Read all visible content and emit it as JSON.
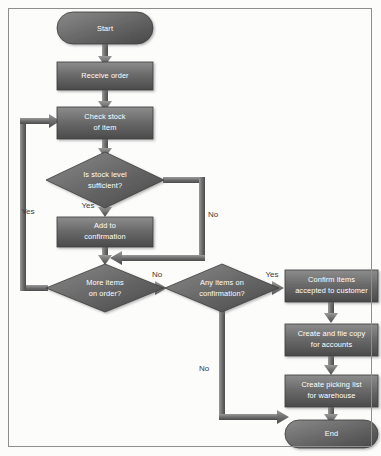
{
  "diagram": {
    "type": "flowchart",
    "canvas": {
      "width": 381,
      "height": 456
    },
    "style": {
      "background": "#fcfcfb",
      "frame_border": "#8e8e8e",
      "node_fill_light": "#8a8a8a",
      "node_fill_dark": "#4e4e4e",
      "node_edge": "#3c3c3c",
      "node_text": "#ffffff",
      "connector": "#6f6f6f",
      "connector_dark": "#4a4a4a",
      "edge_text": "#3a3a3a"
    },
    "nodes": [
      {
        "id": "start",
        "shape": "terminator",
        "label": "Start",
        "x": 105,
        "y": 28,
        "w": 96,
        "h": 32
      },
      {
        "id": "receive",
        "shape": "process",
        "label": "Receive order",
        "x": 105,
        "y": 76,
        "w": 96,
        "h": 28
      },
      {
        "id": "check",
        "shape": "process",
        "label_lines": [
          "Check stock",
          "of item"
        ],
        "x": 105,
        "y": 123,
        "w": 96,
        "h": 32
      },
      {
        "id": "stocklevel",
        "shape": "decision",
        "label_lines": [
          "Is stock level",
          "sufficient?"
        ],
        "x": 105,
        "y": 180,
        "w": 118,
        "h": 56
      },
      {
        "id": "addconf",
        "shape": "process",
        "label_lines": [
          "Add to",
          "confirmation"
        ],
        "x": 105,
        "y": 232,
        "w": 96,
        "h": 30
      },
      {
        "id": "moreitems",
        "shape": "decision",
        "label_lines": [
          "More items",
          "on order?"
        ],
        "x": 105,
        "y": 288,
        "w": 118,
        "h": 48
      },
      {
        "id": "anyitems",
        "shape": "decision",
        "label_lines": [
          "Any items on",
          "confirmation?"
        ],
        "x": 222,
        "y": 288,
        "w": 114,
        "h": 48
      },
      {
        "id": "confirmitems",
        "shape": "process",
        "label_lines": [
          "Confirm items",
          "accepted to customer"
        ],
        "x": 331,
        "y": 286,
        "w": 94,
        "h": 32
      },
      {
        "id": "filecopy",
        "shape": "process",
        "label_lines": [
          "Create and file copy",
          "for accounts"
        ],
        "x": 331,
        "y": 340,
        "w": 94,
        "h": 32
      },
      {
        "id": "pickinglist",
        "shape": "process",
        "label_lines": [
          "Create picking list",
          "for warehouse"
        ],
        "x": 331,
        "y": 391,
        "w": 94,
        "h": 32
      },
      {
        "id": "end",
        "shape": "terminator",
        "label": "End",
        "x": 331,
        "y": 434,
        "w": 96,
        "h": 28
      }
    ],
    "edges": [
      {
        "id": "e-start-receive",
        "from": "start",
        "to": "receive",
        "label": ""
      },
      {
        "id": "e-receive-check",
        "from": "receive",
        "to": "check",
        "label": ""
      },
      {
        "id": "e-check-stocklevel",
        "from": "check",
        "to": "stocklevel",
        "label": ""
      },
      {
        "id": "e-stocklevel-yes",
        "from": "stocklevel",
        "to": "addconf",
        "label": "Yes"
      },
      {
        "id": "e-stocklevel-no",
        "from": "stocklevel",
        "to": "moreitems",
        "label": "No"
      },
      {
        "id": "e-addconf-moreitems",
        "from": "addconf",
        "to": "moreitems",
        "label": ""
      },
      {
        "id": "e-moreitems-yes",
        "from": "moreitems",
        "to": "check",
        "label": "Yes"
      },
      {
        "id": "e-moreitems-no",
        "from": "moreitems",
        "to": "anyitems",
        "label": "No"
      },
      {
        "id": "e-anyitems-yes",
        "from": "anyitems",
        "to": "confirmitems",
        "label": "Yes"
      },
      {
        "id": "e-anyitems-no",
        "from": "anyitems",
        "to": "end",
        "label": "No"
      },
      {
        "id": "e-confirm-filecopy",
        "from": "confirmitems",
        "to": "filecopy",
        "label": ""
      },
      {
        "id": "e-filecopy-picking",
        "from": "filecopy",
        "to": "pickinglist",
        "label": ""
      },
      {
        "id": "e-picking-end",
        "from": "pickinglist",
        "to": "end",
        "label": ""
      }
    ],
    "labels": {
      "start": "Start",
      "receive_order": "Receive order",
      "check_stock_1": "Check stock",
      "check_stock_2": "of item",
      "stock_level_1": "Is stock level",
      "stock_level_2": "sufficient?",
      "add_conf_1": "Add to",
      "add_conf_2": "confirmation",
      "more_items_1": "More items",
      "more_items_2": "on order?",
      "any_items_1": "Any items on",
      "any_items_2": "confirmation?",
      "confirm_items_1": "Confirm items",
      "confirm_items_2": "accepted to customer",
      "file_copy_1": "Create and file copy",
      "file_copy_2": "for accounts",
      "picking_list_1": "Create picking list",
      "picking_list_2": "for warehouse",
      "end": "End",
      "yes_loopback": "Yes",
      "yes_stock": "Yes",
      "no_stock": "No",
      "no_more_items": "No",
      "yes_any_items": "Yes",
      "no_any_items": "No"
    }
  }
}
